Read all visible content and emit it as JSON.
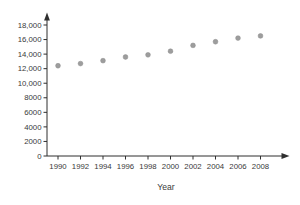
{
  "colors": {
    "background": "#ffffff",
    "axis": "#2f2f2f",
    "tick_label": "#3a3a3a",
    "point_fill": "#9d9d9d",
    "point_stroke": "#8a8a8a"
  },
  "chart_data": {
    "type": "scatter",
    "title": "",
    "xlabel": "Year",
    "ylabel": "",
    "x": [
      1990,
      1992,
      1994,
      1996,
      1998,
      2000,
      2002,
      2004,
      2006,
      2008
    ],
    "values": [
      12400,
      12700,
      13100,
      13600,
      13900,
      14400,
      15200,
      15700,
      16200,
      16500
    ],
    "x_tick_labels": [
      "1990",
      "1992",
      "1994",
      "1996",
      "1998",
      "2000",
      "2002",
      "2004",
      "2006",
      "2008"
    ],
    "y_tick_values": [
      0,
      2000,
      4000,
      6000,
      8000,
      10000,
      12000,
      14000,
      16000,
      18000
    ],
    "y_tick_labels": [
      "0",
      "2000",
      "4000",
      "6000",
      "8000",
      "10,000",
      "12,000",
      "14,000",
      "16,000",
      "18,000"
    ],
    "xlim": [
      1990,
      2008
    ],
    "ylim": [
      0,
      18000
    ],
    "grid": false,
    "legend": "none",
    "marker": "circle"
  }
}
